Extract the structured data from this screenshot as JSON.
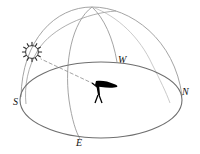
{
  "diagram": {
    "background_color": "#ffffff",
    "line_color": "#8a8a8a",
    "dark_line_color": "#555555",
    "dashed_line_color": "#9a9a9a",
    "figure_color": "#000000",
    "sun_color": "#333333",
    "labels": {
      "south": "S",
      "west": "W",
      "north": "N",
      "east": "E"
    },
    "label_positions": {
      "south": {
        "x": 13,
        "y": 105
      },
      "west": {
        "x": 118,
        "y": 63
      },
      "north": {
        "x": 182,
        "y": 95
      },
      "east": {
        "x": 76,
        "y": 146
      }
    },
    "elements": {
      "sun_icon": "sun-icon",
      "observer_icon": "observer-figure-icon",
      "sight_line": "dashed-sight-line",
      "horizon": "horizon-ellipse",
      "dome": "celestial-dome-arc",
      "meridian_east": "meridian-arc-east",
      "meridian_west": "meridian-arc-west",
      "sun_path": "sun-daily-path-arc"
    },
    "geometry": {
      "zenith": {
        "x": 92,
        "y": 7
      },
      "horizon_center": {
        "x": 101,
        "y": 100
      },
      "horizon_rx": 81,
      "horizon_ry": 38,
      "sun_center": {
        "x": 32,
        "y": 52
      },
      "sun_radius": 8,
      "sun_rays": 12,
      "observer": {
        "x": 98,
        "y": 88
      }
    }
  }
}
